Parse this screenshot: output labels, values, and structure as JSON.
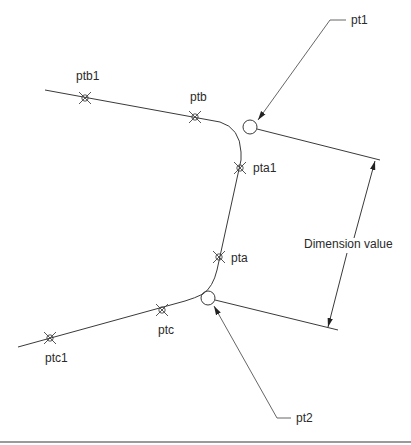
{
  "diagram": {
    "type": "cad-dimension-diagram",
    "labels": {
      "pt1": "pt1",
      "pt2": "pt2",
      "pta": "pta",
      "pta1": "pta1",
      "ptb": "ptb",
      "ptb1": "ptb1",
      "ptc": "ptc",
      "ptc1": "ptc1",
      "dimension": "Dimension value"
    },
    "points": {
      "ptb1": [
        85,
        98
      ],
      "ptb": [
        195,
        117
      ],
      "pta1": [
        240,
        168
      ],
      "pta": [
        213,
        257
      ],
      "ptc": [
        162,
        310
      ],
      "ptc1": [
        50,
        338
      ],
      "pt1": [
        250,
        127
      ],
      "pt2": [
        208,
        298
      ]
    },
    "colors": {
      "line": "#3a3a3a",
      "text": "#2a2a2a",
      "rule": "#9a9a9a"
    }
  }
}
